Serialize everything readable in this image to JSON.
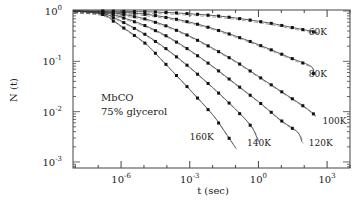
{
  "chart_data": {
    "type": "line",
    "title": "",
    "xlabel": "t (sec)",
    "ylabel": "N (t)",
    "xscale": "log",
    "yscale": "log",
    "xlim_log10": [
      -8.1,
      4.0
    ],
    "ylim_log10": [
      -3.12,
      0.02
    ],
    "x_ticks": [
      {
        "base": "10",
        "exp": "-6",
        "log10": -6
      },
      {
        "base": "10",
        "exp": "-3",
        "log10": -3
      },
      {
        "base": "10",
        "exp": "0",
        "log10": 0
      },
      {
        "base": "10",
        "exp": "3",
        "log10": 3
      }
    ],
    "y_ticks": [
      {
        "base": "10",
        "exp": "0",
        "log10": 0
      },
      {
        "base": "10",
        "exp": "-1",
        "log10": -1
      },
      {
        "base": "10",
        "exp": "-2",
        "log10": -2
      },
      {
        "base": "10",
        "exp": "-3",
        "log10": -3
      }
    ],
    "grid": false,
    "legend": "none",
    "inset_text": [
      "MbCO",
      "75% glycerol"
    ],
    "series": [
      {
        "name": "60K",
        "label_pos_log": [
          2.2,
          -0.48
        ],
        "points_log": [
          [
            -6.8,
            0.0
          ],
          [
            -5.5,
            -0.01
          ],
          [
            -4.5,
            -0.02
          ],
          [
            -3.5,
            -0.04
          ],
          [
            -2.5,
            -0.07
          ],
          [
            -1.5,
            -0.11
          ],
          [
            -0.5,
            -0.17
          ],
          [
            0.5,
            -0.24
          ],
          [
            1.5,
            -0.33
          ],
          [
            2.3,
            -0.4
          ],
          [
            2.6,
            -0.44
          ]
        ]
      },
      {
        "name": "80K",
        "label_pos_log": [
          2.2,
          -1.32
        ],
        "points_log": [
          [
            -6.8,
            -0.01
          ],
          [
            -5.5,
            -0.04
          ],
          [
            -4.5,
            -0.09
          ],
          [
            -3.5,
            -0.17
          ],
          [
            -2.5,
            -0.28
          ],
          [
            -1.5,
            -0.42
          ],
          [
            -0.5,
            -0.58
          ],
          [
            0.5,
            -0.76
          ],
          [
            1.5,
            -0.95
          ],
          [
            2.3,
            -1.1
          ],
          [
            2.4,
            -1.24
          ]
        ]
      },
      {
        "name": "100K",
        "label_pos_log": [
          2.8,
          -2.24
        ],
        "points_log": [
          [
            -6.8,
            -0.02
          ],
          [
            -6.0,
            -0.06
          ],
          [
            -5.0,
            -0.15
          ],
          [
            -4.0,
            -0.3
          ],
          [
            -3.0,
            -0.5
          ],
          [
            -2.0,
            -0.74
          ],
          [
            -1.0,
            -1.0
          ],
          [
            0.0,
            -1.3
          ],
          [
            1.0,
            -1.6
          ],
          [
            2.0,
            -1.9
          ],
          [
            2.5,
            -2.08
          ]
        ]
      },
      {
        "name": "120K",
        "label_pos_log": [
          2.2,
          -2.68
        ],
        "points_log": [
          [
            -6.8,
            -0.03
          ],
          [
            -6.0,
            -0.12
          ],
          [
            -5.0,
            -0.28
          ],
          [
            -4.0,
            -0.5
          ],
          [
            -3.0,
            -0.78
          ],
          [
            -2.0,
            -1.1
          ],
          [
            -1.0,
            -1.45
          ],
          [
            0.0,
            -1.8
          ],
          [
            1.0,
            -2.18
          ],
          [
            1.7,
            -2.4
          ],
          [
            1.9,
            -2.6
          ]
        ]
      },
      {
        "name": "140K",
        "label_pos_log": [
          -0.5,
          -2.68
        ],
        "points_log": [
          [
            -6.8,
            -0.05
          ],
          [
            -6.0,
            -0.2
          ],
          [
            -5.0,
            -0.45
          ],
          [
            -4.0,
            -0.76
          ],
          [
            -3.0,
            -1.12
          ],
          [
            -2.0,
            -1.52
          ],
          [
            -1.0,
            -1.95
          ],
          [
            -0.3,
            -2.3
          ],
          [
            0.0,
            -2.6
          ]
        ]
      },
      {
        "name": "160K",
        "label_pos_log": [
          -3.0,
          -2.56
        ],
        "points_log": [
          [
            -6.8,
            -0.07
          ],
          [
            -6.0,
            -0.3
          ],
          [
            -5.0,
            -0.62
          ],
          [
            -4.5,
            -0.84
          ],
          [
            -4.0,
            -1.08
          ],
          [
            -3.0,
            -1.56
          ],
          [
            -2.0,
            -2.06
          ],
          [
            -1.5,
            -2.38
          ],
          [
            -1.0,
            -2.72
          ]
        ]
      }
    ]
  },
  "axes": {
    "xlabel": "t (sec)",
    "ylabel": "N (t)"
  },
  "inset": {
    "line1": "MbCO",
    "line2": "75% glycerol"
  }
}
